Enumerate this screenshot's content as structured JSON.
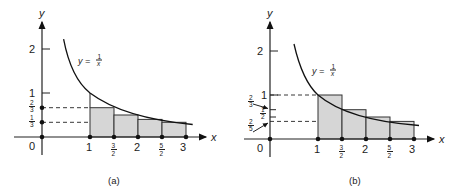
{
  "figure": {
    "panels": [
      {
        "id": "a",
        "caption": "(a)",
        "curve_label": "y = 1/x",
        "curve_label_parts": {
          "lhs": "y =",
          "num": "1",
          "den": "x"
        },
        "axis_labels": {
          "x": "x",
          "y": "y"
        },
        "origin_label": "0",
        "x_ticks": [
          {
            "value": 1,
            "label": "1"
          },
          {
            "value": 1.5,
            "label_num": "3",
            "label_den": "2"
          },
          {
            "value": 2,
            "label": "2"
          },
          {
            "value": 2.5,
            "label_num": "5",
            "label_den": "2"
          },
          {
            "value": 3,
            "label": "3"
          }
        ],
        "y_ticks": [
          {
            "value": 1,
            "label": "1"
          },
          {
            "value": 2,
            "label": "2"
          }
        ],
        "y_marked": [
          {
            "value": 0.6667,
            "label_num": "2",
            "label_den": "3"
          },
          {
            "value": 0.3333,
            "label_num": "1",
            "label_den": "3"
          }
        ],
        "rectangles": "lower (right endpoint) sums",
        "rect_heights": [
          0.6667,
          0.5,
          0.4,
          0.3333
        ]
      },
      {
        "id": "b",
        "caption": "(b)",
        "curve_label": "y = 1/x",
        "curve_label_parts": {
          "lhs": "y =",
          "num": "1",
          "den": "x"
        },
        "axis_labels": {
          "x": "x",
          "y": "y"
        },
        "origin_label": "0",
        "x_ticks": [
          {
            "value": 1,
            "label": "1"
          },
          {
            "value": 1.5,
            "label_num": "3",
            "label_den": "2"
          },
          {
            "value": 2,
            "label": "2"
          },
          {
            "value": 2.5,
            "label_num": "5",
            "label_den": "2"
          },
          {
            "value": 3,
            "label": "3"
          }
        ],
        "y_ticks": [
          {
            "value": 1,
            "label": "1"
          },
          {
            "value": 2,
            "label": "2"
          }
        ],
        "y_marked": [
          {
            "value": 0.6667,
            "label_num": "2",
            "label_den": "3"
          },
          {
            "value": 0.5,
            "label_num": "1",
            "label_den": "2"
          },
          {
            "value": 0.4,
            "label_num": "2",
            "label_den": "5"
          }
        ],
        "rectangles": "upper (left endpoint) sums",
        "rect_heights": [
          1,
          0.6667,
          0.5,
          0.4
        ]
      }
    ]
  }
}
